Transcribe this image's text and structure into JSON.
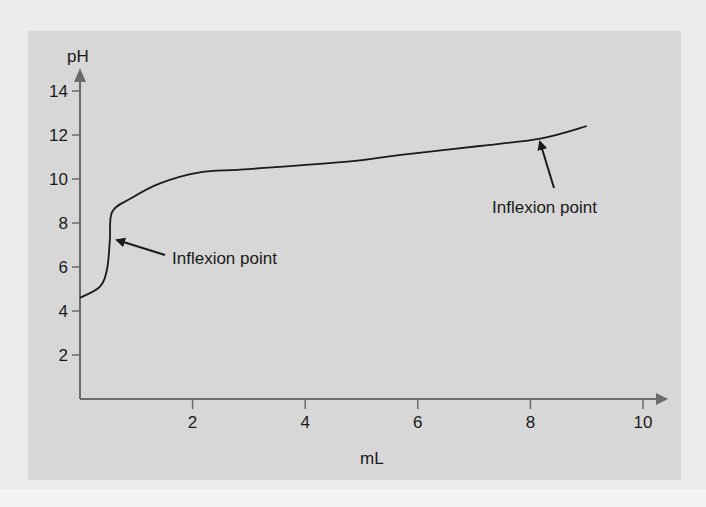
{
  "chart_data": {
    "type": "line",
    "title": "",
    "xlabel": "mL",
    "ylabel": "pH",
    "xlim": [
      0,
      10
    ],
    "ylim": [
      0,
      14
    ],
    "xticks": [
      2,
      4,
      6,
      8,
      10
    ],
    "yticks": [
      2,
      4,
      6,
      8,
      10,
      12,
      14
    ],
    "grid": false,
    "series": [
      {
        "name": "titration curve",
        "x": [
          0,
          0.35,
          0.48,
          0.53,
          0.57,
          0.89,
          1.42,
          2.13,
          3.0,
          4.8,
          5.7,
          7.1,
          8.2,
          9.0
        ],
        "y": [
          4.6,
          5.1,
          5.9,
          7.2,
          8.5,
          9.1,
          9.8,
          10.3,
          10.45,
          10.8,
          11.1,
          11.5,
          11.85,
          12.4
        ]
      }
    ],
    "annotations": [
      {
        "text": "Inflexion point",
        "x": 0.6,
        "y": 7.2
      },
      {
        "text": "Inflexion point",
        "x": 8.1,
        "y": 11.8
      }
    ]
  },
  "colors": {
    "background": "#ececec",
    "panel": "#d7d7d7",
    "axis": "#6b6b6b",
    "curve": "#1a1a1a",
    "text": "#1a1a1a"
  }
}
